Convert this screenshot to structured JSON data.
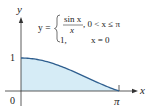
{
  "figure": {
    "axis_labels": {
      "x": "x",
      "y": "y"
    },
    "ticks": {
      "y_one": "1",
      "origin": "0",
      "x_pi": "π"
    },
    "formula": {
      "lhs": "y =",
      "case1_numerator": "sin x",
      "case1_denominator": "x",
      "case1_condition": ",  0 < x ≤ π",
      "case2_value": "1,",
      "case2_condition": "x = 0"
    },
    "colors": {
      "fill": "#d6ecf6",
      "curve": "#2f5f8f",
      "axis": "#333333"
    }
  },
  "chart_data": {
    "type": "area",
    "title": "",
    "function": "y = sin(x)/x for 0 < x ≤ π; y = 1 for x = 0",
    "x": [
      0,
      0.3927,
      0.7854,
      1.1781,
      1.5708,
      1.9635,
      2.3562,
      2.7489,
      3.1416
    ],
    "values": [
      1.0,
      0.9745,
      0.9003,
      0.7842,
      0.6366,
      0.4705,
      0.3001,
      0.1392,
      0.0
    ],
    "xlabel": "x",
    "ylabel": "y",
    "xlim": [
      0,
      3.1416
    ],
    "ylim": [
      0,
      1
    ],
    "x_tick_labels": [
      "0",
      "π"
    ],
    "y_tick_labels": [
      "1"
    ],
    "grid": false,
    "legend": null,
    "shaded_region": "area under curve from 0 to π"
  }
}
